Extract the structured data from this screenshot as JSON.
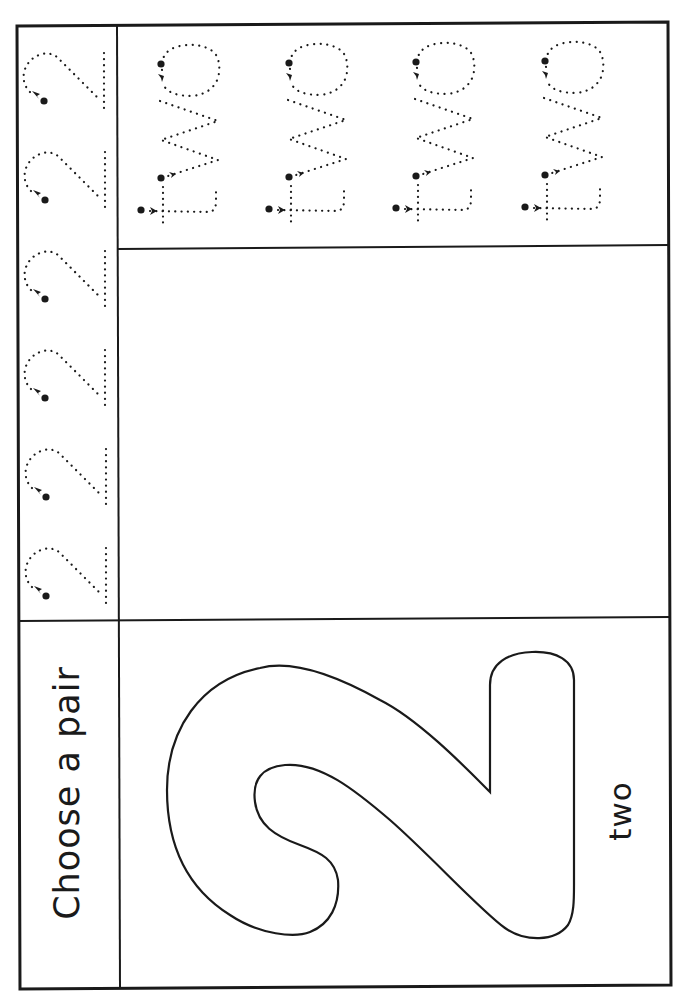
{
  "worksheet": {
    "instruction": "Choose a pair",
    "number_word": "two",
    "big_numeral": "2",
    "colors": {
      "line": "#1a1a1a",
      "background": "#ffffff"
    }
  },
  "sections": {
    "numeral_trace_column": {
      "description": "dotted numeral 2 tracing row",
      "glyph": "2",
      "count": 6
    },
    "word_trace_box": {
      "description": "dotted word two tracing rows",
      "glyph": "two",
      "count": 4
    },
    "drawing_box": {
      "description": "blank drawing area"
    },
    "outline_box": {
      "description": "outline numeral 2 with word label"
    }
  }
}
